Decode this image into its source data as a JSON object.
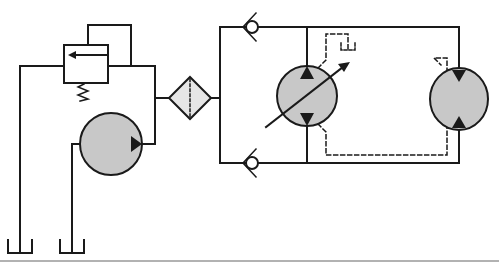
{
  "diagram": {
    "title": "Hydraulic circuit: pump with relief valve, filter, check valves, variable motor and fixed motor",
    "colors": {
      "line": "#1a1a1a",
      "component_fill": "#c8c8c8",
      "filter_fill": "#e6e6e6",
      "background": "#ffffff",
      "bottom_rule": "#999999"
    },
    "components": [
      {
        "id": "relief-valve",
        "label": "Pressure relief valve with spring"
      },
      {
        "id": "pump",
        "label": "Fixed displacement pump"
      },
      {
        "id": "filter",
        "label": "Filter"
      },
      {
        "id": "check-valve-top",
        "label": "Check valve (top)"
      },
      {
        "id": "check-valve-bottom",
        "label": "Check valve (bottom)"
      },
      {
        "id": "variable-motor",
        "label": "Variable displacement bidirectional pump/motor"
      },
      {
        "id": "fixed-motor",
        "label": "Bidirectional hydraulic motor"
      },
      {
        "id": "tank-left",
        "label": "Reservoir (relief return)"
      },
      {
        "id": "tank-right",
        "label": "Reservoir (pump suction)"
      },
      {
        "id": "drain-tank",
        "label": "Case drain reservoir"
      }
    ]
  }
}
